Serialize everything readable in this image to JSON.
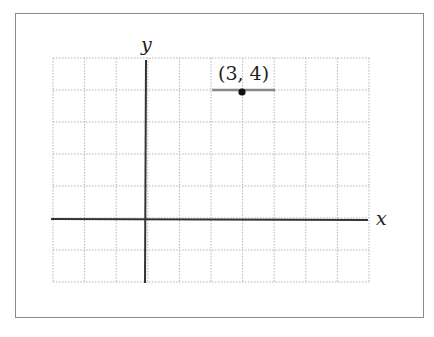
{
  "figure": {
    "axis_x_label": "x",
    "axis_y_label": "y",
    "point_label": "(3, 4)",
    "point": {
      "x": 3,
      "y": 4
    },
    "grid": {
      "x_min": -3,
      "x_max": 7,
      "y_min": -2,
      "y_max": 5
    },
    "colors": {
      "axis": "#333333",
      "grid": "#b5b5b5",
      "segment": "#888888",
      "point": "#111111"
    }
  },
  "chart_data": {
    "type": "scatter",
    "title": "",
    "xlabel": "x",
    "ylabel": "y",
    "xlim": [
      -3,
      7
    ],
    "ylim": [
      -2,
      5
    ],
    "grid": true,
    "points": [
      {
        "x": 3,
        "y": 4,
        "label": "(3, 4)"
      }
    ],
    "annotations": [
      "horizontal segment from x=2 to x=4 at y=4"
    ]
  }
}
